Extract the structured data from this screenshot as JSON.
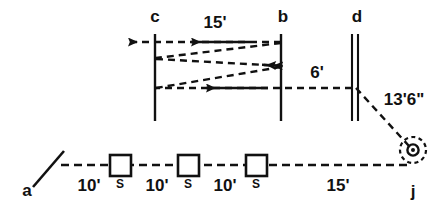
{
  "diagram": {
    "stroke_color": "#111111",
    "background_color": "#ffffff",
    "nodes": [
      {
        "id": "c",
        "label": "c",
        "kind": "single-vertical-line",
        "x": 155,
        "label_x": 155,
        "label_y": 22
      },
      {
        "id": "b",
        "label": "b",
        "kind": "single-vertical-line",
        "x": 281,
        "label_x": 283,
        "label_y": 22
      },
      {
        "id": "d",
        "label": "d",
        "kind": "double-vertical-line",
        "x": 355,
        "label_x": 357,
        "label_y": 22
      },
      {
        "id": "a",
        "label": "a",
        "kind": "tick-mark-station",
        "label_x": 27,
        "label_y": 195
      },
      {
        "id": "j",
        "label": "j",
        "kind": "dashed-circle-station",
        "label_x": 413,
        "label_y": 196
      }
    ],
    "dimensions": [
      {
        "id": "top-run",
        "label": "15'",
        "x": 215,
        "y": 27
      },
      {
        "id": "mid-run",
        "label": "6'",
        "x": 317,
        "y": 77
      },
      {
        "id": "slope-run",
        "label": "13'6\"",
        "x": 404,
        "y": 104
      },
      {
        "id": "leg-1",
        "label": "10'",
        "x": 91,
        "y": 190
      },
      {
        "id": "leg-2",
        "label": "10'",
        "x": 159,
        "y": 190
      },
      {
        "id": "leg-3",
        "label": "10'",
        "x": 227,
        "y": 190
      },
      {
        "id": "leg-4",
        "label": "15'",
        "x": 338,
        "y": 190
      }
    ],
    "stations": [
      {
        "id": "station-1",
        "label": "S",
        "x": 120,
        "y": 165
      },
      {
        "id": "station-2",
        "label": "S",
        "x": 188,
        "y": 165
      },
      {
        "id": "station-3",
        "label": "S",
        "x": 256,
        "y": 165
      }
    ]
  }
}
